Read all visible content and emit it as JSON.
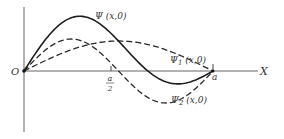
{
  "diagram": {
    "axis": {
      "x_label": "X",
      "origin_label": "O",
      "tick_half_numerator": "a",
      "tick_half_denominator": "2",
      "tick_end_label": "a"
    },
    "curves": [
      {
        "id": "psi",
        "label": "Ψ (x,0)",
        "style": "solid",
        "description": "sum Ψ1 + Ψ2"
      },
      {
        "id": "psi1",
        "label_main": "Ψ",
        "label_sub": "1",
        "label_rest": " (x,0)",
        "style": "dashed",
        "description": "ground state, sin(πx/a)"
      },
      {
        "id": "psi2",
        "label_main": "Ψ",
        "label_sub": "2",
        "label_rest": " (x,0)",
        "style": "dashed",
        "description": "first excited state, sin(2πx/a)"
      }
    ],
    "colors": {
      "ink": "#2a2a2a",
      "axis": "#555555",
      "background": "#ffffff"
    }
  }
}
